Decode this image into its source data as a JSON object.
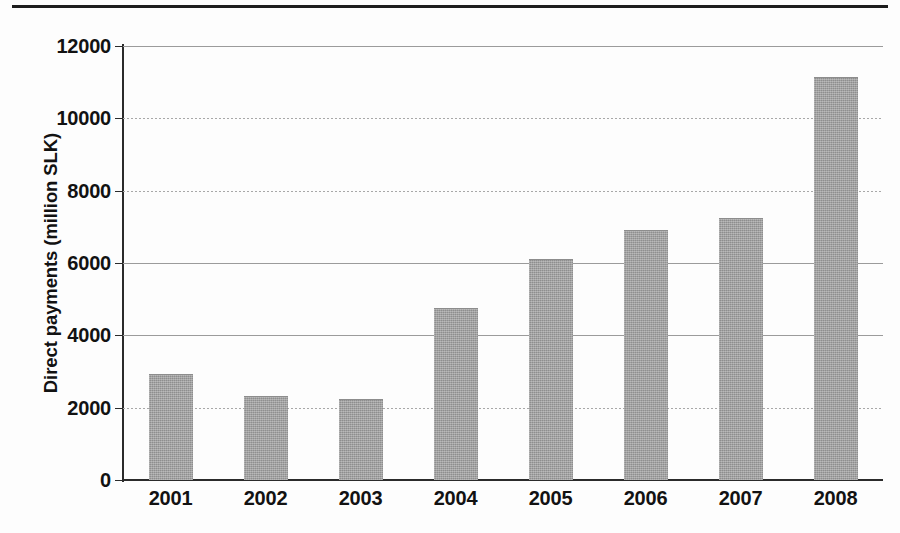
{
  "page": {
    "separator_rule": "horizontal-rule",
    "background_color": "#fdfdfd"
  },
  "chart_data": {
    "type": "bar",
    "title": "",
    "xlabel": "",
    "ylabel": "Direct payments (million SLK)",
    "categories": [
      "2001",
      "2002",
      "2003",
      "2004",
      "2005",
      "2006",
      "2007",
      "2008"
    ],
    "values": [
      2930,
      2320,
      2250,
      4760,
      6100,
      6900,
      7250,
      11150
    ],
    "ylim": [
      0,
      12000
    ],
    "ytick_labels": [
      "12000",
      "10000",
      "8000",
      "6000",
      "4000",
      "2000",
      "0"
    ],
    "ytick_values": [
      12000,
      10000,
      8000,
      6000,
      4000,
      2000,
      0
    ],
    "ytick_style": [
      "solid",
      "dotted",
      "dotted",
      "solid",
      "solid",
      "dotted",
      "axis"
    ],
    "grid": true,
    "legend": null,
    "series": [
      {
        "name": "Direct payments",
        "values": [
          2930,
          2320,
          2250,
          4760,
          6100,
          6900,
          7250,
          11150
        ],
        "color": "#9c9c9c"
      }
    ]
  },
  "colors": {
    "bar_fill": "#9c9c9c",
    "axis": "#2b2b2b",
    "gridline": "#9b9b9b",
    "text": "#121212",
    "rule": "#1d1d1d"
  }
}
